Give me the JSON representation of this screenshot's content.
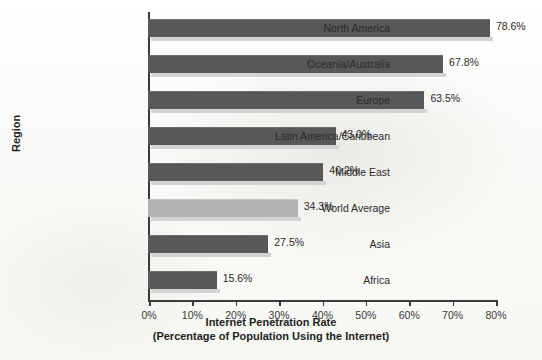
{
  "chart_data": {
    "type": "bar",
    "orientation": "horizontal",
    "title": "",
    "xlabel": "Internet Penetration Rate",
    "xlabel_sub": "(Percentage of Population Using the Internet)",
    "ylabel": "Region",
    "xlim": [
      0,
      80
    ],
    "grid": false,
    "legend": "none",
    "xticks": [
      "0%",
      "10%",
      "20%",
      "30%",
      "40%",
      "50%",
      "60%",
      "70%",
      "80%"
    ],
    "xtick_values": [
      0,
      10,
      20,
      30,
      40,
      50,
      60,
      70,
      80
    ],
    "categories": [
      "North America",
      "Oceania/Australia",
      "Europe",
      "Latin America/Caribbean",
      "Middle East",
      "World Average",
      "Asia",
      "Africa"
    ],
    "values": [
      78.6,
      67.8,
      63.5,
      43.0,
      40.2,
      34.3,
      27.5,
      15.6
    ],
    "value_labels": [
      "78.6%",
      "67.8%",
      "63.5%",
      "43.0%",
      "40.2%",
      "34.3%",
      "27.5%",
      "15.6%"
    ],
    "highlight_category": "World Average",
    "colors": {
      "bar": "#585858",
      "bar_highlight": "#b2b2b2",
      "bar_shadow": "#d3d3d3",
      "axis": "#3a3a3a",
      "text": "#2b2b2b",
      "background": "#fbfbf9"
    }
  }
}
